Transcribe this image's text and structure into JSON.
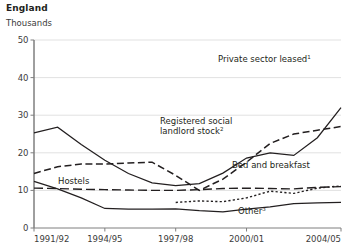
{
  "header": {
    "title": "England",
    "units_label": "Thousands"
  },
  "chart_data": {
    "type": "line",
    "title": "England",
    "subtitle": "Thousands",
    "xlabel": "",
    "ylabel": "Thousands",
    "ylim": [
      0,
      50
    ],
    "yticks": [
      0,
      10,
      20,
      30,
      40,
      50
    ],
    "grid": true,
    "legend": "inline-annotations",
    "x": [
      "1991/92",
      "1992/93",
      "1993/94",
      "1994/95",
      "1995/96",
      "1996/97",
      "1997/98",
      "1998/99",
      "1999/00",
      "2000/01",
      "2001/02",
      "2002/03",
      "2003/04",
      "2004/05"
    ],
    "xticklabels": [
      "1991/92",
      "1994/95",
      "1997/98",
      "2000/01",
      "2004/05"
    ],
    "xtick_indices": [
      0,
      3,
      6,
      9,
      13
    ],
    "series": [
      {
        "name": "Private sector leased",
        "footnote": "1",
        "style": "solid",
        "values": [
          25.3,
          26.8,
          22.2,
          18.0,
          14.5,
          12.0,
          11.3,
          11.8,
          14.6,
          18.6,
          20.0,
          19.3,
          24.0,
          32.0
        ]
      },
      {
        "name": "Registered social landlord stock",
        "footnote": "2",
        "style": "dashed",
        "values": [
          14.5,
          16.3,
          17.0,
          17.0,
          17.3,
          17.5,
          14.0,
          10.0,
          13.0,
          17.5,
          22.5,
          25.0,
          26.0,
          27.0
        ]
      },
      {
        "name": "Hostels",
        "footnote": "",
        "style": "long-dash",
        "values": [
          10.6,
          10.5,
          10.3,
          10.2,
          10.1,
          10.0,
          10.0,
          10.2,
          10.5,
          10.6,
          10.5,
          10.4,
          10.8,
          11.0
        ]
      },
      {
        "name": "Bed and breakfast",
        "footnote": "",
        "style": "solid",
        "values": [
          12.4,
          10.4,
          8.0,
          5.2,
          5.0,
          5.0,
          5.1,
          4.6,
          4.3,
          5.0,
          5.6,
          6.5,
          6.7,
          6.8
        ]
      },
      {
        "name": "Other",
        "footnote": "3",
        "style": "dotted",
        "values": [
          null,
          null,
          null,
          null,
          null,
          null,
          6.8,
          7.2,
          7.0,
          8.0,
          9.8,
          9.2,
          10.6,
          11.2
        ]
      }
    ],
    "annotations": [
      {
        "text": "Private sector leased",
        "footnote": "1"
      },
      {
        "text": "Registered social",
        "footnote": ""
      },
      {
        "text": "landlord stock",
        "footnote": "2"
      },
      {
        "text": "Hostels",
        "footnote": ""
      },
      {
        "text": "Bed and breakfast",
        "footnote": ""
      },
      {
        "text": "Other",
        "footnote": "3"
      }
    ]
  }
}
